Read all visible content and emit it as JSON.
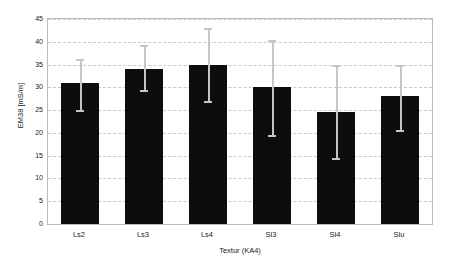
{
  "chart_data": {
    "type": "bar",
    "title": "",
    "xlabel": "Textur (KA4)",
    "ylabel": "EM38 [mS/m]",
    "categories": [
      "Ls2",
      "Ls3",
      "Ls4",
      "Sl3",
      "Sl4",
      "Slu"
    ],
    "values": [
      30.9,
      34.0,
      35.0,
      30.0,
      24.5,
      28.0
    ],
    "error_low": [
      25.0,
      29.5,
      27.0,
      19.5,
      14.5,
      20.7
    ],
    "error_high": [
      36.3,
      39.3,
      43.0,
      40.3,
      34.8,
      35.0
    ],
    "ylim": [
      0,
      45
    ],
    "yticks": [
      0,
      5,
      10,
      15,
      20,
      25,
      30,
      35,
      40,
      45
    ],
    "ytick_labels": [
      "0",
      "5",
      "10",
      "15",
      "20",
      "25",
      "30",
      "35",
      "40",
      "45"
    ],
    "grid": true,
    "grid_axis": "y",
    "legend": false,
    "legend_position": "none",
    "bar_color": "#0d0d0d",
    "error_color": "#c6c6c6",
    "grid_color": "#c9c9c9",
    "plot_border_color": "#b9b9b9",
    "background_color": "#ffffff"
  }
}
